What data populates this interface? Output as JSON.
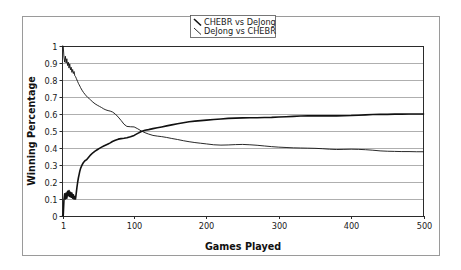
{
  "chart_data": {
    "type": "line",
    "title": "",
    "xlabel": "Games Played",
    "ylabel": "Winning Percentage",
    "xlim": [
      1,
      500
    ],
    "ylim": [
      0,
      1
    ],
    "grid": true,
    "grid_axis": "y",
    "legend_position": "top-center",
    "x_ticks": [
      1,
      100,
      200,
      300,
      400,
      500
    ],
    "x_tick_labels": [
      "1",
      "100",
      "200",
      "300",
      "400",
      "500"
    ],
    "y_ticks": [
      0,
      0.1,
      0.2,
      0.3,
      0.4,
      0.5,
      0.6,
      0.7,
      0.8,
      0.9,
      1
    ],
    "y_tick_labels": [
      "0",
      "0.1",
      "0.2",
      "0.3",
      "0.4",
      "0.5",
      "0.6",
      "0.7",
      "0.8",
      "0.9",
      "1"
    ],
    "series": [
      {
        "name": "CHEBR vs DeJong",
        "color": "#111111",
        "line_width": 1.6,
        "x": [
          1,
          2,
          3,
          4,
          5,
          6,
          7,
          8,
          9,
          10,
          11,
          12,
          13,
          14,
          15,
          16,
          17,
          18,
          19,
          20,
          21,
          22,
          23,
          24,
          25,
          26,
          28,
          30,
          32,
          34,
          36,
          38,
          40,
          43,
          46,
          49,
          52,
          55,
          58,
          61,
          64,
          67,
          70,
          74,
          78,
          82,
          86,
          90,
          95,
          100,
          105,
          110,
          115,
          120,
          126,
          132,
          138,
          145,
          152,
          160,
          168,
          176,
          184,
          192,
          200,
          210,
          220,
          230,
          240,
          250,
          260,
          270,
          280,
          290,
          300,
          310,
          320,
          330,
          340,
          350,
          360,
          370,
          380,
          390,
          400,
          410,
          420,
          430,
          440,
          450,
          460,
          470,
          480,
          490,
          500
        ],
        "y": [
          0,
          0,
          0.095,
          0.13,
          0.1,
          0.135,
          0.105,
          0.145,
          0.12,
          0.15,
          0.115,
          0.14,
          0.11,
          0.135,
          0.105,
          0.125,
          0.1,
          0.115,
          0.1,
          0.135,
          0.17,
          0.2,
          0.225,
          0.245,
          0.265,
          0.28,
          0.3,
          0.315,
          0.325,
          0.33,
          0.34,
          0.35,
          0.36,
          0.372,
          0.382,
          0.39,
          0.398,
          0.405,
          0.412,
          0.418,
          0.424,
          0.43,
          0.438,
          0.446,
          0.452,
          0.455,
          0.457,
          0.46,
          0.466,
          0.474,
          0.486,
          0.497,
          0.504,
          0.508,
          0.514,
          0.519,
          0.524,
          0.53,
          0.536,
          0.543,
          0.549,
          0.554,
          0.558,
          0.561,
          0.564,
          0.568,
          0.571,
          0.574,
          0.576,
          0.577,
          0.578,
          0.578,
          0.579,
          0.58,
          0.582,
          0.584,
          0.586,
          0.588,
          0.589,
          0.589,
          0.59,
          0.589,
          0.589,
          0.59,
          0.591,
          0.593,
          0.595,
          0.597,
          0.598,
          0.598,
          0.599,
          0.599,
          0.6,
          0.6,
          0.6
        ]
      },
      {
        "name": "DeJong vs CHEBR",
        "color": "#111111",
        "line_width": 0.9,
        "x": [
          1,
          2,
          3,
          4,
          5,
          6,
          7,
          8,
          9,
          10,
          11,
          12,
          13,
          14,
          15,
          16,
          17,
          18,
          19,
          20,
          21,
          22,
          23,
          24,
          25,
          26,
          28,
          30,
          32,
          34,
          36,
          38,
          40,
          43,
          46,
          49,
          52,
          55,
          58,
          61,
          64,
          67,
          70,
          74,
          78,
          82,
          86,
          90,
          95,
          100,
          105,
          110,
          115,
          120,
          126,
          132,
          138,
          145,
          152,
          160,
          168,
          176,
          184,
          192,
          200,
          210,
          220,
          230,
          240,
          250,
          260,
          270,
          280,
          290,
          300,
          310,
          320,
          330,
          340,
          350,
          360,
          370,
          380,
          390,
          400,
          410,
          420,
          430,
          440,
          450,
          460,
          470,
          480,
          490,
          500
        ],
        "y": [
          1,
          1,
          0.935,
          0.905,
          0.94,
          0.9,
          0.925,
          0.885,
          0.905,
          0.87,
          0.895,
          0.86,
          0.875,
          0.845,
          0.862,
          0.838,
          0.85,
          0.825,
          0.82,
          0.81,
          0.8,
          0.79,
          0.78,
          0.772,
          0.764,
          0.755,
          0.74,
          0.727,
          0.716,
          0.706,
          0.697,
          0.69,
          0.682,
          0.67,
          0.66,
          0.652,
          0.645,
          0.638,
          0.63,
          0.624,
          0.62,
          0.617,
          0.612,
          0.6,
          0.582,
          0.562,
          0.54,
          0.527,
          0.525,
          0.524,
          0.513,
          0.5,
          0.49,
          0.482,
          0.474,
          0.47,
          0.467,
          0.462,
          0.456,
          0.45,
          0.443,
          0.437,
          0.432,
          0.428,
          0.424,
          0.419,
          0.417,
          0.418,
          0.42,
          0.421,
          0.419,
          0.416,
          0.412,
          0.408,
          0.405,
          0.403,
          0.401,
          0.4,
          0.399,
          0.398,
          0.396,
          0.393,
          0.391,
          0.392,
          0.393,
          0.392,
          0.39,
          0.387,
          0.383,
          0.381,
          0.38,
          0.379,
          0.379,
          0.378,
          0.378
        ]
      }
    ]
  },
  "legend": {
    "items": [
      {
        "label": "CHEBR vs DeJong",
        "marker": "line-slash"
      },
      {
        "label": "DeJong vs CHEBR",
        "marker": "line-slash"
      }
    ]
  },
  "axes": {
    "x_title": "Games Played",
    "y_title": "Winning Percentage"
  }
}
